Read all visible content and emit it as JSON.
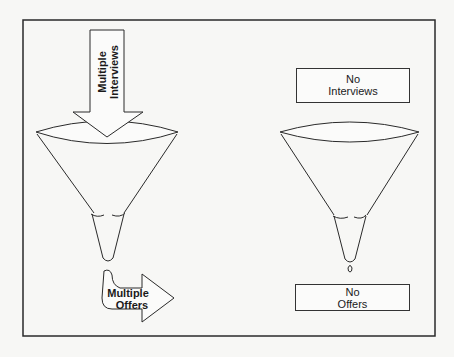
{
  "diagram": {
    "left_panel": {
      "input_arrow_label_line1": "Multiple",
      "input_arrow_label_line2": "Interviews",
      "output_arrow_label_line1": "Multiple",
      "output_arrow_label_line2": "Offers"
    },
    "right_panel": {
      "input_box_label_line1": "No",
      "input_box_label_line2": "Interviews",
      "output_box_label_line1": "No",
      "output_box_label_line2": "Offers"
    },
    "colors": {
      "line": "#2a2a2a",
      "background": "#f7f7f5"
    }
  }
}
